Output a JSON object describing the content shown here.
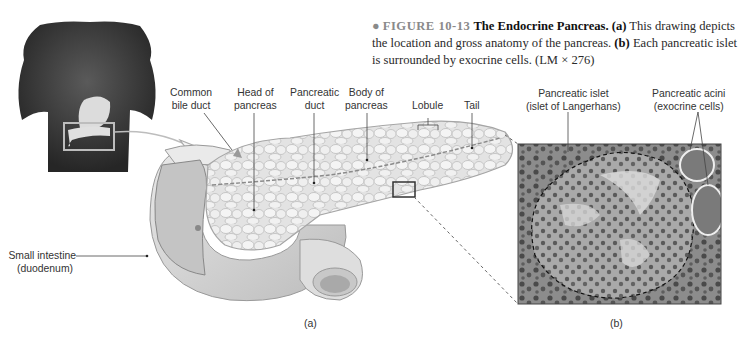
{
  "caption": {
    "bullet": "●",
    "figure_number": "FIGURE 10-13",
    "title": "The Endocrine Pancreas.",
    "part_a_label": "(a)",
    "part_a_text": " This drawing depicts the location and gross anatomy of the pancreas. ",
    "part_b_label": "(b)",
    "part_b_text": " Each pancreatic islet is surrounded by exocrine cells. (LM × 276)"
  },
  "labels": {
    "common_bile_duct": [
      "Common",
      "bile duct"
    ],
    "head_of_pancreas": [
      "Head of",
      "pancreas"
    ],
    "pancreatic_duct": [
      "Pancreatic",
      "duct"
    ],
    "body_of_pancreas": [
      "Body of",
      "pancreas"
    ],
    "lobule": "Lobule",
    "tail": "Tail",
    "small_intestine": [
      "Small intestine",
      "(duodenum)"
    ],
    "pancreatic_islet": [
      "Pancreatic islet",
      "(islet of Langerhans)"
    ],
    "pancreatic_acini": [
      "Pancreatic acini",
      "(exocrine cells)"
    ]
  },
  "panels": {
    "a": "(a)",
    "b": "(b)"
  },
  "colors": {
    "figure_gray": "#8a8a8a",
    "torso": "#3a3a3a",
    "organ_light": "#e6e6e6",
    "micrograph_bg": "#7d7d7d",
    "islet": "#bdbdbd"
  }
}
